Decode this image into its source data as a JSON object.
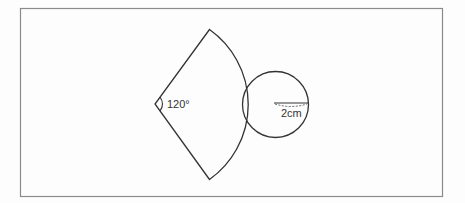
{
  "figure": {
    "frame": {
      "x": 20.5,
      "y": 8.5,
      "width": 422,
      "height": 188,
      "stroke": "#8a8a8a"
    },
    "sector": {
      "apex": [
        155,
        104
      ],
      "top": [
        209.5,
        29.5
      ],
      "bottom": [
        209.5,
        179.5
      ],
      "arc_radius": 92,
      "angle_label": "120°",
      "stroke": "#333333"
    },
    "circle": {
      "center": [
        275.5,
        104.5
      ],
      "radius": 33,
      "radius_label": "2cm",
      "stroke": "#333333"
    }
  }
}
